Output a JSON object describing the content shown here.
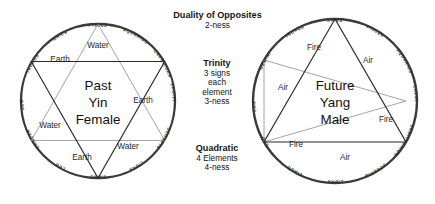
{
  "diagram": {
    "zodiac_order_counterclockwise": [
      "ARIES",
      "TAURUS",
      "GEMINI",
      "CANCER",
      "LEO",
      "VIRGO",
      "LIBRA",
      "SCORPIO",
      "SAGITTARIUS",
      "CAPRICORN",
      "AQUARIUS",
      "PISCES"
    ]
  },
  "left_wheel": {
    "name": "past-yin-female-wheel",
    "core_lines": [
      "Past",
      "Yin",
      "Female"
    ],
    "top_sign": "PISCES",
    "signs": [
      "PISCES",
      "ARIES",
      "TAURUS",
      "GEMINI",
      "CANCER",
      "LEO",
      "VIRGO",
      "LIBRA",
      "SCORPIO",
      "SAGITTARIUS",
      "CAPRICORN",
      "AQUARIUS"
    ],
    "dark_triangle": {
      "element": "Earth",
      "signs": [
        "TAURUS",
        "VIRGO",
        "CAPRICORN"
      ]
    },
    "light_triangle": {
      "element": "Water",
      "signs": [
        "PISCES",
        "CANCER",
        "SCORPIO"
      ]
    },
    "element_labels": [
      {
        "text": "Water",
        "position": "top"
      },
      {
        "text": "Earth",
        "position": "upper-left"
      },
      {
        "text": "Earth",
        "position": "right"
      },
      {
        "text": "Water",
        "position": "left"
      },
      {
        "text": "Water",
        "position": "lower-right"
      },
      {
        "text": "Earth",
        "position": "lower-left"
      }
    ]
  },
  "right_wheel": {
    "name": "future-yang-male-wheel",
    "core_lines": [
      "Future",
      "Yang",
      "Male"
    ],
    "top_sign": "ARIES",
    "signs": [
      "ARIES",
      "TAURUS",
      "GEMINI",
      "CANCER",
      "LEO",
      "VIRGO",
      "LIBRA",
      "SCORPIO",
      "SAGITTARIUS",
      "CAPRICORN",
      "AQUARIUS",
      "PISCES"
    ],
    "dark_triangle": {
      "element": "Fire",
      "signs": [
        "ARIES",
        "LEO",
        "SAGITTARIUS"
      ]
    },
    "light_triangle": {
      "element": "Air",
      "signs": [
        "GEMINI",
        "LIBRA",
        "AQUARIUS"
      ]
    },
    "element_labels": [
      {
        "text": "Fire",
        "position": "upper-left"
      },
      {
        "text": "Air",
        "position": "upper-right"
      },
      {
        "text": "Air",
        "position": "left"
      },
      {
        "text": "Fire",
        "position": "right"
      },
      {
        "text": "Fire",
        "position": "lower-left"
      },
      {
        "text": "Air",
        "position": "bottom"
      }
    ]
  },
  "center_text": {
    "block1": {
      "title": "Duality of Opposites",
      "lines": [
        "2-ness"
      ]
    },
    "block2": {
      "title": "Trinity",
      "lines": [
        "3 signs",
        "each",
        "element",
        "3-ness"
      ]
    },
    "block3": {
      "title": "Quadratic",
      "lines": [
        "4 Elements",
        "4-ness"
      ]
    }
  },
  "colors": {
    "rim": "#3a3a3a",
    "dark_triangle": "#2b2b2b",
    "light_triangle": "#9a9a9a",
    "text": "#141414",
    "background": "#ffffff"
  }
}
